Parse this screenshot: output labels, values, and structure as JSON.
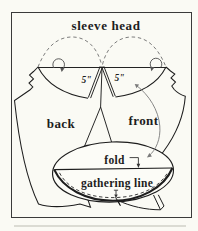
{
  "figure": {
    "title": "sleeve head",
    "labels": {
      "back": "back",
      "front": "front",
      "fold": "fold",
      "gathering_line": "gathering line",
      "measurement_left": "5\"",
      "measurement_right": "5\""
    },
    "colors": {
      "paper": "#fafaf4",
      "ink": "#1d1d1d",
      "dash_gray": "#6e6e6e",
      "arrow_gray": "#7a7a7a"
    }
  }
}
